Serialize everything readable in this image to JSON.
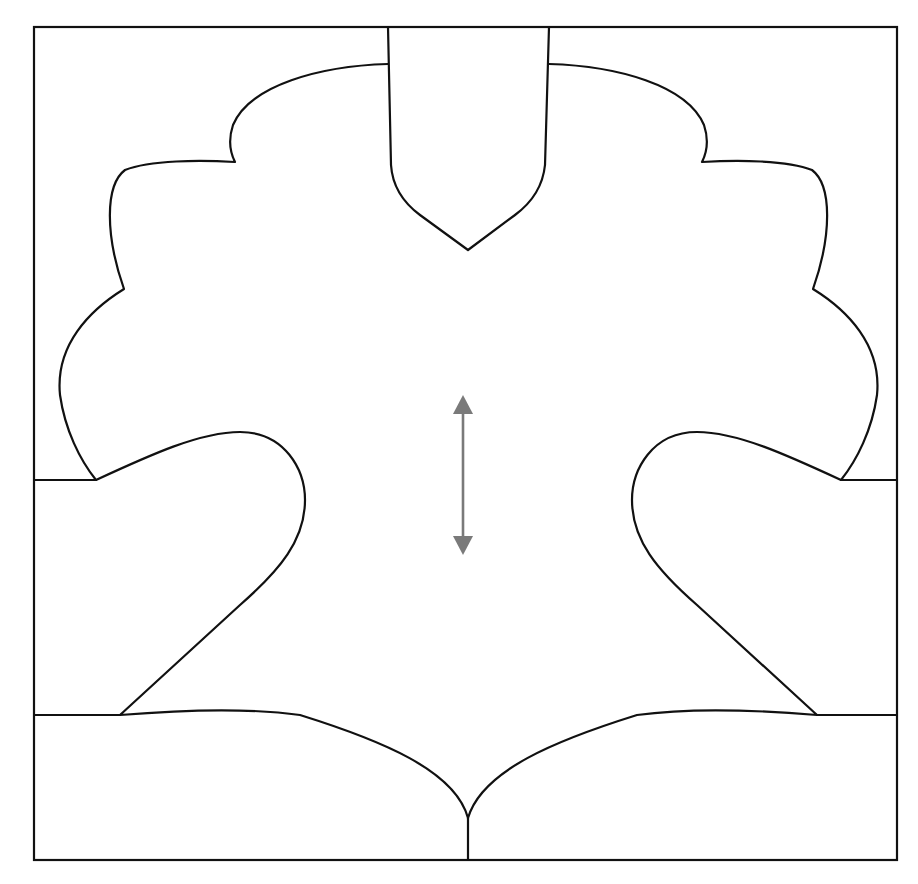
{
  "diagram": {
    "title": "",
    "colors": {
      "background": "#ffffff",
      "outline": "#111111",
      "arrow": "#7a7a7a"
    },
    "frame": {
      "x": 34,
      "y": 27,
      "width": 863,
      "height": 833
    },
    "center_x": 468,
    "arrow": {
      "icon": "double-headed-vertical-arrow",
      "x": 463,
      "y1": 395,
      "y2": 555
    }
  }
}
